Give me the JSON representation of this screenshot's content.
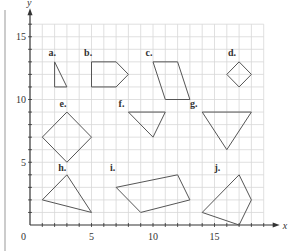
{
  "figure": {
    "x_axis_label": "x",
    "y_axis_label": "y",
    "origin_label": "0",
    "x_ticks": [
      {
        "value": 5,
        "label": "5"
      },
      {
        "value": 10,
        "label": "10"
      },
      {
        "value": 15,
        "label": "15"
      }
    ],
    "y_ticks": [
      {
        "value": 5,
        "label": "5"
      },
      {
        "value": 10,
        "label": "10"
      },
      {
        "value": 15,
        "label": "15"
      }
    ],
    "x_range": [
      0,
      19
    ],
    "y_range": [
      0,
      16
    ],
    "colors": {
      "grid": "#d8d8d8",
      "axis": "#333333",
      "shape": "#555555",
      "frame": "#bbbbbb"
    },
    "shapes": [
      {
        "id": "a",
        "label": "a.",
        "label_at": [
          1.5,
          13.5
        ],
        "points": [
          [
            2,
            13
          ],
          [
            2,
            11
          ],
          [
            3,
            11
          ]
        ]
      },
      {
        "id": "b",
        "label": "b.",
        "label_at": [
          4.4,
          13.5
        ],
        "points": [
          [
            5,
            13
          ],
          [
            7,
            13
          ],
          [
            8,
            12
          ],
          [
            7,
            11
          ],
          [
            5,
            11
          ]
        ]
      },
      {
        "id": "c",
        "label": "c.",
        "label_at": [
          9.4,
          13.5
        ],
        "points": [
          [
            10,
            13
          ],
          [
            12,
            13
          ],
          [
            13,
            10
          ],
          [
            11,
            10
          ]
        ]
      },
      {
        "id": "d",
        "label": "d.",
        "label_at": [
          16.1,
          13.5
        ],
        "points": [
          [
            17,
            13
          ],
          [
            18,
            12
          ],
          [
            17,
            11
          ],
          [
            16,
            12
          ]
        ]
      },
      {
        "id": "e",
        "label": "e.",
        "label_at": [
          2.4,
          9.4
        ],
        "points": [
          [
            3,
            9
          ],
          [
            5,
            7
          ],
          [
            3,
            5
          ],
          [
            1,
            7
          ]
        ]
      },
      {
        "id": "f",
        "label": "f.",
        "label_at": [
          7.2,
          9.4
        ],
        "points": [
          [
            8,
            9
          ],
          [
            11,
            9
          ],
          [
            10,
            7
          ]
        ]
      },
      {
        "id": "g",
        "label": "g.",
        "label_at": [
          13.0,
          9.4
        ],
        "points": [
          [
            14,
            9
          ],
          [
            18,
            9
          ],
          [
            16,
            6
          ]
        ]
      },
      {
        "id": "h",
        "label": "h.",
        "label_at": [
          2.3,
          4.3
        ],
        "points": [
          [
            3,
            4
          ],
          [
            5,
            1
          ],
          [
            1,
            2
          ]
        ]
      },
      {
        "id": "i",
        "label": "i.",
        "label_at": [
          6.5,
          4.3
        ],
        "points": [
          [
            7,
            3
          ],
          [
            12,
            4
          ],
          [
            13,
            2
          ],
          [
            9,
            1
          ]
        ]
      },
      {
        "id": "j",
        "label": "j.",
        "label_at": [
          15.0,
          4.3
        ],
        "points": [
          [
            17,
            4
          ],
          [
            18,
            2
          ],
          [
            17,
            0
          ],
          [
            14,
            1
          ]
        ]
      }
    ]
  }
}
